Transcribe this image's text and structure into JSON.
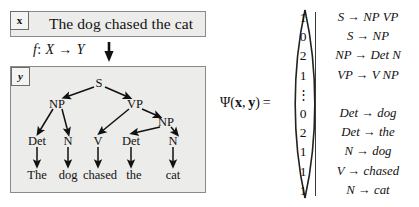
{
  "figure": {
    "input": {
      "tag": "x",
      "sentence": "The dog chased the cat"
    },
    "mapping": {
      "function": "f",
      "colon": ":",
      "domain": "X",
      "arrow": "→",
      "codomain": "Y",
      "arrow_icon": "down-arrow-icon"
    },
    "output": {
      "tag": "y",
      "tree": {
        "root": "S",
        "nodes": [
          {
            "id": "S",
            "label": "S",
            "x": 89,
            "y": 17
          },
          {
            "id": "NP1",
            "label": "NP",
            "x": 47,
            "y": 38
          },
          {
            "id": "VP",
            "label": "VP",
            "x": 125,
            "y": 38
          },
          {
            "id": "NP2",
            "label": "NP",
            "x": 155,
            "y": 56
          },
          {
            "id": "Det1",
            "label": "Det",
            "x": 27,
            "y": 76
          },
          {
            "id": "N1",
            "label": "N",
            "x": 58,
            "y": 76
          },
          {
            "id": "V",
            "label": "V",
            "x": 87,
            "y": 76
          },
          {
            "id": "Det2",
            "label": "Det",
            "x": 121,
            "y": 76
          },
          {
            "id": "N2",
            "label": "N",
            "x": 163,
            "y": 76
          }
        ],
        "leaves": [
          {
            "id": "w1",
            "label": "The",
            "x": 27,
            "y": 110
          },
          {
            "id": "w2",
            "label": "dog",
            "x": 58,
            "y": 110
          },
          {
            "id": "w3",
            "label": "chased",
            "x": 90,
            "y": 110
          },
          {
            "id": "w4",
            "label": "the",
            "x": 124,
            "y": 110
          },
          {
            "id": "w5",
            "label": "cat",
            "x": 163,
            "y": 110
          }
        ]
      }
    },
    "feature_vector": {
      "label_psi": "Ψ",
      "label_open": "(",
      "label_x": "x",
      "label_comma": ",",
      "label_y": "y",
      "label_close": ")",
      "label_equals": "=",
      "entries": [
        {
          "value": "1",
          "rule_lhs": "S",
          "arrow": "→",
          "rule_rhs": "NP VP",
          "rule": "S → NP VP"
        },
        {
          "value": "0",
          "rule_lhs": "S",
          "arrow": "→",
          "rule_rhs": "NP",
          "rule": "S → NP"
        },
        {
          "value": "2",
          "rule_lhs": "NP",
          "arrow": "→",
          "rule_rhs": "Det N",
          "rule": "NP → Det N"
        },
        {
          "value": "1",
          "rule_lhs": "VP",
          "arrow": "→",
          "rule_rhs": "V NP",
          "rule": "VP → V NP"
        },
        {
          "value": "⋮",
          "rule_lhs": "",
          "arrow": "",
          "rule_rhs": "",
          "rule": ""
        },
        {
          "value": "0",
          "rule_lhs": "Det",
          "arrow": "→",
          "rule_rhs": "dog",
          "rule": "Det → dog"
        },
        {
          "value": "2",
          "rule_lhs": "Det",
          "arrow": "→",
          "rule_rhs": "the",
          "rule": "Det → the"
        },
        {
          "value": "1",
          "rule_lhs": "N",
          "arrow": "→",
          "rule_rhs": "dog",
          "rule": "N → dog"
        },
        {
          "value": "1",
          "rule_lhs": "V",
          "arrow": "→",
          "rule_rhs": "chased",
          "rule": "V → chased"
        },
        {
          "value": "1",
          "rule_lhs": "N",
          "arrow": "→",
          "rule_rhs": "cat",
          "rule": "N → cat"
        }
      ]
    },
    "colors": {
      "panel_fill": "#ececea",
      "panel_border": "#8a8a8a",
      "tag_fill": "#f4f4f2",
      "ink": "#111111",
      "page": "#ffffff"
    }
  }
}
